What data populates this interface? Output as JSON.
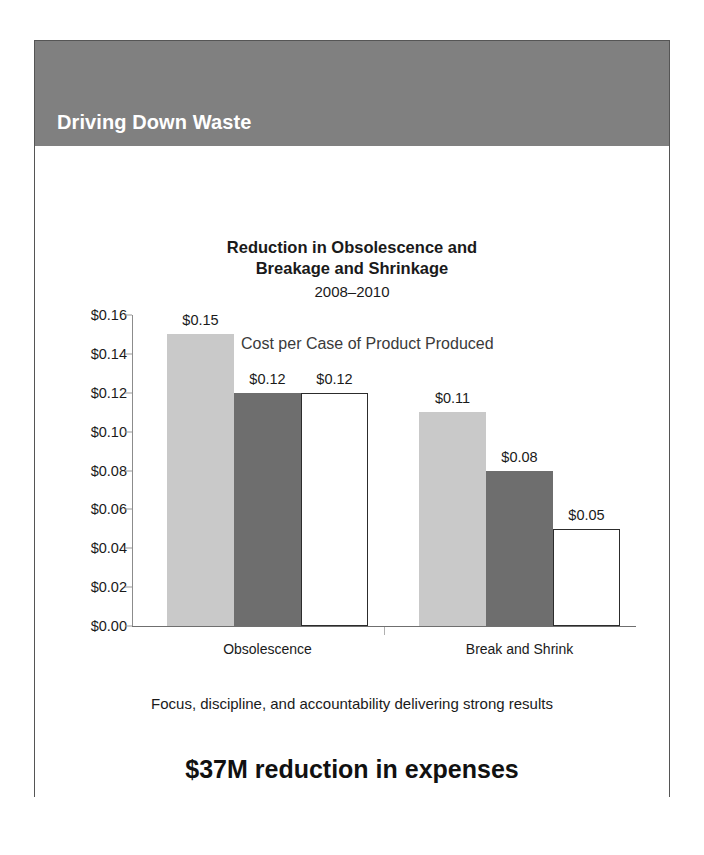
{
  "slide": {
    "header_title": "Driving Down Waste",
    "header_bg": "#808080",
    "frame_border": "#555555",
    "footer_note": "Focus, discipline, and accountability delivering strong results",
    "footer_headline": "$37M reduction in expenses"
  },
  "chart_data": {
    "type": "bar",
    "title": "Reduction in Obsolescence and Breakage and Shrinkage",
    "title_line1": "Reduction in Obsolescence and",
    "title_line2": "Breakage and Shrinkage",
    "subtitle": "2008–2010",
    "annotation": "Cost per Case of Product Produced",
    "xlabel": "",
    "ylabel": "",
    "ylim": [
      0,
      0.16
    ],
    "ytick_step": 0.02,
    "ytick_labels": [
      "$0.16",
      "$0.14",
      "$0.12",
      "$0.10",
      "$0.08",
      "$0.06",
      "$0.04",
      "$0.02",
      "$0.00"
    ],
    "ytick_values": [
      0.16,
      0.14,
      0.12,
      0.1,
      0.08,
      0.06,
      0.04,
      0.02,
      0.0
    ],
    "grid": false,
    "legend": "none",
    "categories": [
      "Obsolescence",
      "Break and Shrink"
    ],
    "series": [
      {
        "name": "2008",
        "style": "light-gray-fill",
        "color": "#c9c9c9",
        "values": [
          0.15,
          0.11
        ],
        "labels": [
          "$0.15",
          "$0.11"
        ]
      },
      {
        "name": "2009",
        "style": "dark-gray-fill",
        "color": "#6e6e6e",
        "values": [
          0.12,
          0.08
        ],
        "labels": [
          "$0.12",
          "$0.08"
        ]
      },
      {
        "name": "2010",
        "style": "white-outline",
        "color": "#ffffff",
        "values": [
          0.12,
          0.05
        ],
        "labels": [
          "$0.12",
          "$0.05"
        ]
      }
    ]
  }
}
